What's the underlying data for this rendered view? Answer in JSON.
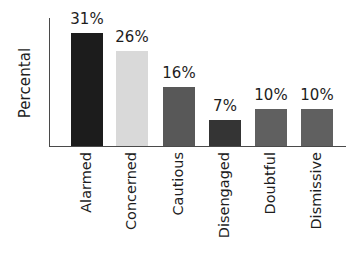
{
  "chart_data": {
    "type": "bar",
    "title": "",
    "subtitle": "",
    "xlabel": "",
    "ylabel": "Percental",
    "ylim": [
      0,
      35
    ],
    "grid": false,
    "legend": null,
    "categories": [
      "Alarmed",
      "Concerned",
      "Cautious",
      "Disengaged",
      "Doubtful",
      "Dismissive"
    ],
    "values": [
      31,
      26,
      16,
      7,
      10,
      10
    ],
    "value_labels": [
      "31%",
      "26%",
      "16%",
      "7%",
      "10%",
      "10%"
    ],
    "bar_colors": [
      "#1c1c1c",
      "#d9d9d9",
      "#585858",
      "#343434",
      "#606060",
      "#606060"
    ],
    "axis_color": "#4a4a4a",
    "background": "#ffffff",
    "text_color": "#1d1d1d"
  },
  "axes": {
    "y_title": "Percental"
  },
  "bars": [
    {
      "category": "Alarmed",
      "value": 31,
      "label": "31%",
      "color": "#1c1c1c"
    },
    {
      "category": "Concerned",
      "value": 26,
      "label": "26%",
      "color": "#d9d9d9"
    },
    {
      "category": "Cautious",
      "value": 16,
      "label": "16%",
      "color": "#585858"
    },
    {
      "category": "Disengaged",
      "value": 7,
      "label": "7%",
      "color": "#343434"
    },
    {
      "category": "Doubtful",
      "value": 10,
      "label": "10%",
      "color": "#606060"
    },
    {
      "category": "Dismissive",
      "value": 10,
      "label": "10%",
      "color": "#606060"
    }
  ]
}
